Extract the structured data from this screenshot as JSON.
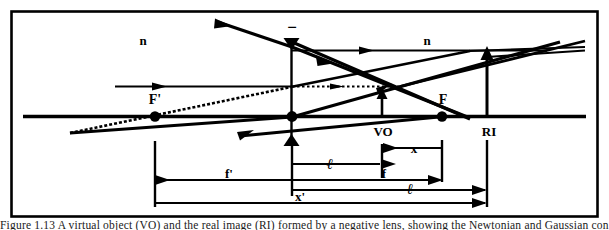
{
  "figure": {
    "kind": "optics-ray-diagram",
    "frame": {
      "stroke": "#000000"
    },
    "ink_color": "#000000",
    "background": "#ffffff"
  },
  "labels": {
    "index_left": "n",
    "index_right": "n",
    "lens_sign": "−",
    "front_focal_point": "F'",
    "back_focal_point": "F",
    "virtual_object": "VO",
    "real_image": "RI"
  },
  "dimensions": [
    {
      "id": "x",
      "label": "x",
      "from": "virtual-object",
      "to": "back-focal-point"
    },
    {
      "id": "ell",
      "label": "ℓ",
      "from": "lens",
      "to": "virtual-object"
    },
    {
      "id": "f",
      "label": "f",
      "from": "lens",
      "to": "back-focal-point"
    },
    {
      "id": "ell-prime",
      "label": "ℓ",
      "from": "lens",
      "to": "real-image"
    },
    {
      "id": "f-prime",
      "label": "f'",
      "from": "lens",
      "to": "front-focal-point"
    },
    {
      "id": "x-prime",
      "label": "x'",
      "from": "front-focal-point",
      "to": "real-image"
    }
  ],
  "caption": {
    "text": "Figure 1.13  A virtual object (VO) and the real image (RI) formed by a negative lens, showing the Newtonian and Gaussian conjugate distances"
  }
}
